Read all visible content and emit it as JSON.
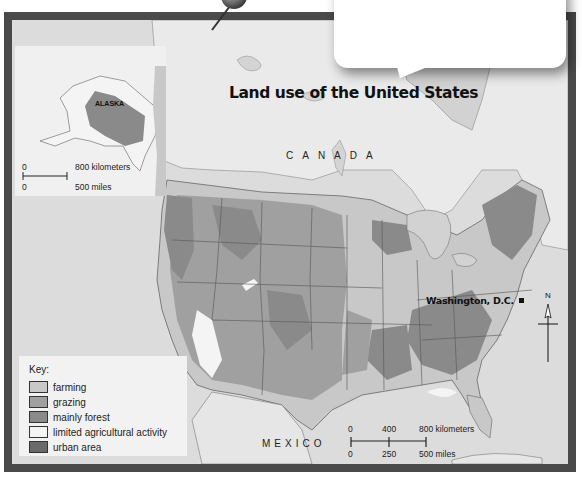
{
  "map": {
    "title": "Land use of the United States",
    "labels": {
      "canada": "CANADA",
      "mexico": "MEXICO",
      "alaska": "ALASKA",
      "capital": "Washington, D.C."
    },
    "inset_scale": {
      "km_zero": "0",
      "km_max": "800 kilometers",
      "mi_zero": "0",
      "mi_max": "500 miles"
    },
    "main_scale": {
      "km_ticks": [
        "0",
        "400",
        "800 kilometers"
      ],
      "mi_ticks": [
        "0",
        "250",
        "500 miles"
      ]
    },
    "compass": {
      "north_label": "N"
    },
    "legend": {
      "title": "Key:",
      "items": [
        {
          "label": "farming",
          "color": "#c8c8c8"
        },
        {
          "label": "grazing",
          "color": "#a0a0a0"
        },
        {
          "label": "mainly forest",
          "color": "#8a8a8a"
        },
        {
          "label": "limited agricultural activity",
          "color": "#f4f4f4"
        },
        {
          "label": "urban area",
          "color": "#6a6a6a"
        }
      ]
    },
    "colors": {
      "frame": "#4a4a4a",
      "water": "#dcdcdc",
      "canada_land": "#eaeaea",
      "farming": "#c8c8c8",
      "grazing": "#a0a0a0",
      "forest": "#8a8a8a",
      "limited": "#f4f4f4",
      "urban": "#6a6a6a"
    }
  },
  "callout": {
    "text": ""
  }
}
